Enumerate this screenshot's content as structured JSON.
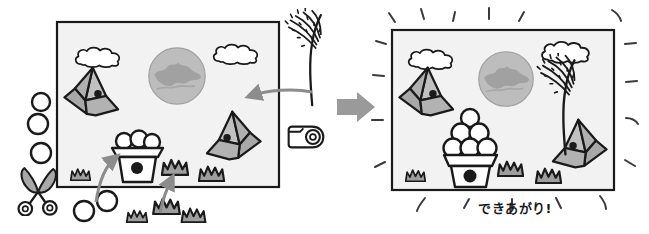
{
  "scene": {
    "title": "paper-craft-before-after-illustration",
    "caption": "できあがり!",
    "colors": {
      "panel_fill": "#f2f2f2",
      "panel_border": "#1a1a1a",
      "origami_fill": "#a8a8a8",
      "origami_fill_light": "#c4c4c4",
      "moon_fill": "#b5b5b5",
      "moon_pattern": "#9a9a9a",
      "grass_fill": "#9e9e9e",
      "cloud_fill": "#ffffff",
      "arrow_gray": "#8c8c8c",
      "ink_black": "#1a1a1a",
      "scissors_fill": "#a8a8a8"
    }
  },
  "left_panel": {
    "name": "work-in-progress-panel",
    "frame": {
      "x": 57,
      "y": 22,
      "width": 222,
      "height": 165
    },
    "clouds": [
      {
        "name": "cloud-upper-left",
        "cx": 95,
        "cy": 59,
        "scale": 1.0
      },
      {
        "name": "cloud-upper-right",
        "cx": 235,
        "cy": 57,
        "scale": 1.0
      }
    ],
    "moon": {
      "name": "moon",
      "cx": 177,
      "cy": 76,
      "r": 30
    },
    "origami_birds": [
      {
        "name": "origami-bird-left",
        "x": 66,
        "y": 68,
        "flip": false
      },
      {
        "name": "origami-bird-right",
        "x": 203,
        "y": 108,
        "flip": false
      }
    ],
    "flower_pot": {
      "name": "flower-pot",
      "x": 113,
      "y": 136,
      "flower_count": 3
    },
    "grass_inside": [
      {
        "name": "grass-tuft-inside-1",
        "x": 70,
        "y": 167,
        "w": 18,
        "h": 12
      },
      {
        "name": "grass-tuft-inside-2",
        "x": 163,
        "y": 158,
        "w": 25,
        "h": 16
      },
      {
        "name": "grass-tuft-inside-3",
        "x": 200,
        "y": 165,
        "w": 24,
        "h": 15
      }
    ],
    "loose_circles": [
      {
        "name": "loose-circle-1",
        "cx": 41,
        "cy": 103,
        "r": 9
      },
      {
        "name": "loose-circle-2",
        "cx": 38,
        "cy": 124,
        "r": 10
      },
      {
        "name": "loose-circle-3",
        "cx": 41,
        "cy": 154,
        "r": 10
      },
      {
        "name": "loose-circle-4",
        "cx": 94,
        "cy": 203,
        "r": 9
      },
      {
        "name": "loose-circle-5",
        "cx": 70,
        "cy": 214,
        "r": 9
      }
    ],
    "loose_grass": [
      {
        "name": "grass-tuft-loose-1",
        "x": 124,
        "y": 207,
        "w": 21,
        "h": 14
      },
      {
        "name": "grass-tuft-loose-2",
        "x": 152,
        "y": 197,
        "w": 27,
        "h": 18
      },
      {
        "name": "grass-tuft-loose-3",
        "x": 180,
        "y": 206,
        "w": 25,
        "h": 15
      }
    ],
    "scissors": {
      "name": "scissors-tool",
      "x": 18,
      "y": 168
    },
    "tape": {
      "name": "tape-dispenser-tool",
      "x": 288,
      "y": 122
    },
    "firework": {
      "name": "firework-sparkler-piece",
      "x": 282,
      "y": 10
    },
    "arrows": [
      {
        "name": "paste-arrow-to-sky",
        "from": [
          310,
          92
        ],
        "to": [
          245,
          98
        ]
      },
      {
        "name": "paste-arrow-to-pot",
        "from": [
          95,
          200
        ],
        "to": [
          118,
          155
        ]
      },
      {
        "name": "paste-arrow-to-grass",
        "from": [
          163,
          212
        ],
        "to": [
          173,
          176
        ]
      }
    ]
  },
  "transition_arrow": {
    "name": "step-arrow",
    "x": 337,
    "y": 92,
    "width": 38,
    "height": 30
  },
  "right_panel": {
    "name": "finished-panel",
    "frame": {
      "x": 392,
      "y": 30,
      "width": 222,
      "height": 160
    },
    "clouds": [
      {
        "name": "cloud-upper-left",
        "cx": 430,
        "cy": 58,
        "scale": 1.0
      },
      {
        "name": "cloud-upper-right",
        "cx": 567,
        "cy": 53,
        "scale": 1.05
      }
    ],
    "moon": {
      "name": "moon",
      "cx": 505,
      "cy": 80,
      "r": 28
    },
    "origami_birds": [
      {
        "name": "origami-bird-left",
        "x": 400,
        "y": 68,
        "flip": false
      },
      {
        "name": "origami-bird-right",
        "x": 548,
        "y": 118,
        "flip": false
      }
    ],
    "flower_pot": {
      "name": "flower-pot",
      "x": 447,
      "y": 108,
      "flower_count": 6
    },
    "grass_inside": [
      {
        "name": "grass-tuft-inside-1",
        "x": 405,
        "y": 167,
        "w": 18,
        "h": 12
      },
      {
        "name": "grass-tuft-inside-2",
        "x": 495,
        "y": 160,
        "w": 24,
        "h": 16
      },
      {
        "name": "grass-tuft-inside-3",
        "x": 535,
        "y": 166,
        "w": 24,
        "h": 15
      }
    ],
    "firework": {
      "name": "firework-sparkler-attached",
      "x": 540,
      "y": 60
    },
    "sparkles_count": 18
  }
}
